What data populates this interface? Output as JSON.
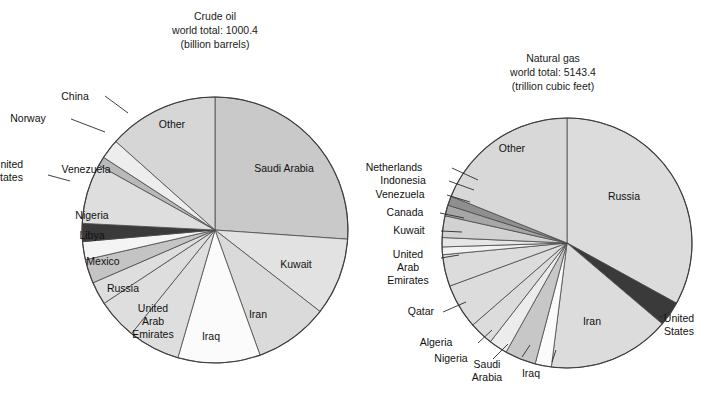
{
  "figure": {
    "background": "#ffffff",
    "type": "two-pie-figure"
  },
  "chart_data": [
    {
      "type": "pie",
      "id": "crude-oil",
      "title": "Crude oil",
      "subtitle_total": "world total: 1000.4",
      "subtitle_units": "(billion barrels)",
      "title_lines": [
        "Crude oil",
        "world total: 1000.4",
        "(billion barrels)"
      ],
      "center": [
        215,
        230
      ],
      "radius": 133,
      "start_angle_deg": -90,
      "direction": "clockwise",
      "legend": "inside-and-outside labels with leader lines",
      "categories": [
        "Saudi Arabia",
        "Kuwait",
        "Iran",
        "Iraq",
        "United Arab Emirates",
        "Russia",
        "Mexico",
        "Libya",
        "Nigeria",
        "United States",
        "Venezuela",
        "Norway",
        "China",
        "Other"
      ],
      "values": [
        261.5,
        94.0,
        89.7,
        100.0,
        62.8,
        48.6,
        28.3,
        29.5,
        22.5,
        22.0,
        72.6,
        10.9,
        24.0,
        134.0
      ],
      "percent": [
        26.1,
        9.4,
        9.0,
        10.0,
        6.3,
        4.9,
        2.8,
        2.9,
        2.2,
        2.2,
        7.3,
        1.1,
        2.4,
        13.4
      ],
      "slices": [
        {
          "label": "Saudi Arabia",
          "percent": 26.1,
          "fill": "#c9c9c9",
          "label_pos": "inside",
          "label_x": 284,
          "label_y": 172
        },
        {
          "label": "Kuwait",
          "percent": 9.4,
          "fill": "#e2e2e2",
          "label_pos": "inside",
          "label_x": 296,
          "label_y": 268
        },
        {
          "label": "Iran",
          "percent": 9.0,
          "fill": "#dadada",
          "label_pos": "inside",
          "label_x": 258,
          "label_y": 318
        },
        {
          "label": "Iraq",
          "percent": 10.0,
          "fill": "#fbfbfb",
          "label_pos": "inside",
          "label_x": 211,
          "label_y": 340
        },
        {
          "label": "United Arab Emirates",
          "percent": 6.3,
          "fill": "#dedede",
          "label_pos": "inside",
          "label_x": 153,
          "label_y": 312,
          "lines": [
            "United",
            "Arab",
            "Emirates"
          ]
        },
        {
          "label": "Russia",
          "percent": 4.9,
          "fill": "#dedede",
          "label_pos": "inside",
          "label_x": 123,
          "label_y": 292
        },
        {
          "label": "Mexico",
          "percent": 2.8,
          "fill": "#dedede",
          "label_pos": "inside",
          "label_x": 103,
          "label_y": 265
        },
        {
          "label": "Libya",
          "percent": 2.9,
          "fill": "#c4c4c4",
          "label_pos": "inside",
          "label_x": 92,
          "label_y": 239
        },
        {
          "label": "Nigeria",
          "percent": 2.2,
          "fill": "#f4f4f4",
          "label_pos": "inside",
          "label_x": 92,
          "label_y": 219
        },
        {
          "label": "United States",
          "percent": 2.2,
          "fill": "#3a3a3a",
          "label_pos": "outside",
          "label_x": 8,
          "label_y": 168,
          "lines": [
            "United",
            "States"
          ]
        },
        {
          "label": "Venezuela",
          "percent": 7.3,
          "fill": "#dedede",
          "label_pos": "inside",
          "label_x": 86,
          "label_y": 173
        },
        {
          "label": "Norway",
          "percent": 1.1,
          "fill": "#b9b9b9",
          "label_pos": "outside",
          "label_x": 28,
          "label_y": 122
        },
        {
          "label": "China",
          "percent": 2.4,
          "fill": "#ededed",
          "label_pos": "outside",
          "label_x": 75,
          "label_y": 100
        },
        {
          "label": "Other",
          "percent": 13.4,
          "fill": "#d6d6d6",
          "label_pos": "inside",
          "label_x": 172,
          "label_y": 128
        }
      ]
    },
    {
      "type": "pie",
      "id": "natural-gas",
      "title": "Natural gas",
      "subtitle_total": "world total: 5143.4",
      "subtitle_units": "(trillion cubic feet)",
      "title_lines": [
        "Natural gas",
        "world total: 5143.4",
        "(trillion cubic feet)"
      ],
      "center": [
        567,
        243
      ],
      "radius": 125,
      "start_angle_deg": -90,
      "direction": "clockwise",
      "legend": "inside-and-outside labels with leader lines",
      "categories": [
        "Russia",
        "United States",
        "Iran",
        "Iraq",
        "Saudi Arabia",
        "Nigeria",
        "Algeria",
        "Qatar",
        "United Arab Emirates",
        "Kuwait",
        "Canada",
        "Venezuela",
        "Indonesia",
        "Netherlands",
        "Other"
      ],
      "values": [
        1700.0,
        167.0,
        812.0,
        110.0,
        204.5,
        124.0,
        160.0,
        300.0,
        212.0,
        52.0,
        63.0,
        143.0,
        72.3,
        62.0,
        961.6
      ],
      "percent": [
        33.0,
        3.2,
        15.8,
        2.1,
        4.0,
        2.4,
        3.1,
        5.8,
        4.1,
        1.0,
        1.2,
        2.8,
        1.4,
        1.2,
        18.9
      ],
      "slices": [
        {
          "label": "Russia",
          "percent": 33.0,
          "fill": "#dcdcdc",
          "label_pos": "inside",
          "label_x": 624,
          "label_y": 200
        },
        {
          "label": "United States",
          "percent": 3.2,
          "fill": "#3a3a3a",
          "label_pos": "outside",
          "label_x": 679,
          "label_y": 322,
          "lines": [
            "United",
            "States"
          ]
        },
        {
          "label": "Iran",
          "percent": 15.8,
          "fill": "#dcdcdc",
          "label_pos": "inside",
          "label_x": 592,
          "label_y": 325
        },
        {
          "label": "Iraq",
          "percent": 2.1,
          "fill": "#fbfbfb",
          "label_pos": "outside",
          "label_x": 531,
          "label_y": 377
        },
        {
          "label": "Saudi Arabia",
          "percent": 4.0,
          "fill": "#c7c7c7",
          "label_pos": "outside",
          "label_x": 487,
          "label_y": 368,
          "lines": [
            "Saudi",
            "Arabia"
          ]
        },
        {
          "label": "Nigeria",
          "percent": 2.4,
          "fill": "#ececec",
          "label_pos": "outside",
          "label_x": 451,
          "label_y": 362
        },
        {
          "label": "Algeria",
          "percent": 3.1,
          "fill": "#dcdcdc",
          "label_pos": "outside",
          "label_x": 436,
          "label_y": 346
        },
        {
          "label": "Qatar",
          "percent": 5.8,
          "fill": "#dcdcdc",
          "label_pos": "outside",
          "label_x": 421,
          "label_y": 315
        },
        {
          "label": "United Arab Emirates",
          "percent": 4.1,
          "fill": "#dcdcdc",
          "label_pos": "outside",
          "label_x": 408,
          "label_y": 258,
          "lines": [
            "United",
            "Arab",
            "Emirates"
          ]
        },
        {
          "label": "Kuwait",
          "percent": 1.0,
          "fill": "#f2f2f2",
          "label_pos": "outside",
          "label_x": 409,
          "label_y": 234
        },
        {
          "label": "Canada",
          "percent": 1.2,
          "fill": "#e6e6e6",
          "label_pos": "outside",
          "label_x": 405,
          "label_y": 216
        },
        {
          "label": "Venezuela",
          "percent": 2.8,
          "fill": "#d2d2d2",
          "label_pos": "outside",
          "label_x": 400,
          "label_y": 198
        },
        {
          "label": "Indonesia",
          "percent": 1.4,
          "fill": "#a6a6a6",
          "label_pos": "outside",
          "label_x": 403,
          "label_y": 184
        },
        {
          "label": "Netherlands",
          "percent": 1.2,
          "fill": "#8f8f8f",
          "label_pos": "outside",
          "label_x": 394,
          "label_y": 171
        },
        {
          "label": "Other",
          "percent": 18.9,
          "fill": "#d8d8d8",
          "label_pos": "inside",
          "label_x": 512,
          "label_y": 152
        }
      ]
    }
  ]
}
